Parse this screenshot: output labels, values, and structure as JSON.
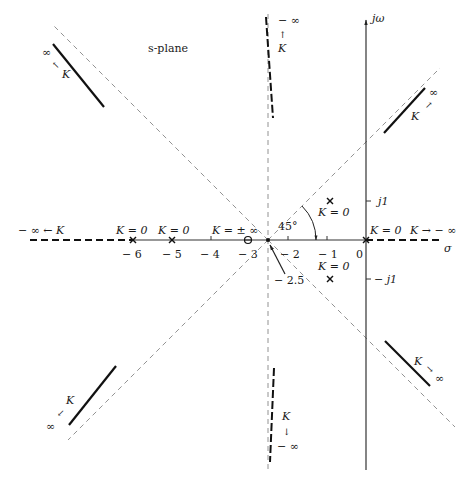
{
  "title": "s-plane",
  "axes": {
    "real_label": "σ",
    "imag_label": "jω",
    "origin_px": [
      366,
      240
    ],
    "px_per_unit": 39,
    "real_ticks": [
      {
        "value": -6,
        "label": "− 6"
      },
      {
        "value": -5,
        "label": "− 5"
      },
      {
        "value": -4,
        "label": "− 4"
      },
      {
        "value": -3,
        "label": "− 3"
      },
      {
        "value": -2,
        "label": "− 2"
      },
      {
        "value": -1,
        "label": "− 1"
      },
      {
        "value": 0,
        "label": "0"
      }
    ],
    "imag_ticks": [
      {
        "value": 1,
        "label": "j1"
      },
      {
        "value": -1,
        "label": "− j1"
      }
    ]
  },
  "centroid": {
    "value": -2.5,
    "label": "− 2.5",
    "angle_label": "45°"
  },
  "poles": [
    {
      "re": 0,
      "im": 0,
      "label": "K = 0"
    },
    {
      "re": -5,
      "im": 0,
      "label": "K = 0"
    },
    {
      "re": -6,
      "im": 0,
      "label": "K = 0"
    },
    {
      "re": -1,
      "im": 1,
      "label": "K = 0"
    },
    {
      "re": -1,
      "im": -1,
      "label": "K = 0"
    }
  ],
  "zeros": [
    {
      "re": -3,
      "im": 0,
      "label": "K = ± ∞"
    }
  ],
  "locus_labels": {
    "left_real": "− ∞ ← K",
    "right_real": "K → − ∞",
    "up_imag": {
      "inf": "− ∞",
      "arrow": "↑",
      "k": "K"
    },
    "down_imag": {
      "inf": "− ∞",
      "arrow": "↓",
      "k": "K"
    },
    "upper_left": {
      "inf": "∞",
      "arrow": "↖",
      "k": "K"
    },
    "upper_right": {
      "inf": "∞",
      "arrow": "↗",
      "k": "K"
    },
    "lower_left": {
      "inf": "∞",
      "arrow": "↙",
      "k": "K"
    },
    "lower_right": {
      "inf": "∞",
      "arrow": "↘",
      "k": "K"
    }
  }
}
